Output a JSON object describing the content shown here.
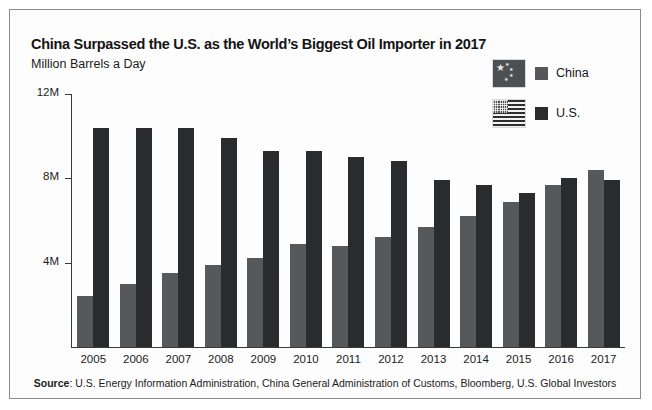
{
  "header": {
    "title": "China Surpassed the U.S. as the World’s Biggest Oil Importer in 2017",
    "subtitle": "Million Barrels a Day"
  },
  "legend": {
    "items": [
      {
        "label": "China",
        "flag": "china-flag-icon",
        "color": "#55595b"
      },
      {
        "label": "U.S.",
        "flag": "us-flag-icon",
        "color": "#2a2b2d"
      }
    ]
  },
  "footer": {
    "source_label": "Source",
    "source_text": ": U.S. Energy Information Administration, China General Administration of Customs, Bloomberg, U.S. Global Investors"
  },
  "chart_data": {
    "type": "bar",
    "title": "China Surpassed the U.S. as the World’s Biggest Oil Importer in 2017",
    "subtitle": "Million Barrels a Day",
    "xlabel": "",
    "ylabel": "Million Barrels a Day",
    "ylim": [
      0,
      12
    ],
    "yticks": [
      4,
      8,
      12
    ],
    "ytick_labels": [
      "4M",
      "8M",
      "12M"
    ],
    "grid": false,
    "legend_position": "top-right",
    "categories": [
      "2005",
      "2006",
      "2007",
      "2008",
      "2009",
      "2010",
      "2011",
      "2012",
      "2013",
      "2014",
      "2015",
      "2016",
      "2017"
    ],
    "series": [
      {
        "name": "China",
        "color": "#55595b",
        "values": [
          2.4,
          3.0,
          3.5,
          3.9,
          4.2,
          4.9,
          4.8,
          5.2,
          5.7,
          6.2,
          6.9,
          7.7,
          8.4
        ]
      },
      {
        "name": "U.S.",
        "color": "#2a2b2d",
        "values": [
          10.4,
          10.4,
          10.4,
          9.9,
          9.3,
          9.3,
          9.0,
          8.8,
          7.9,
          7.7,
          7.3,
          8.0,
          7.9
        ]
      }
    ]
  }
}
